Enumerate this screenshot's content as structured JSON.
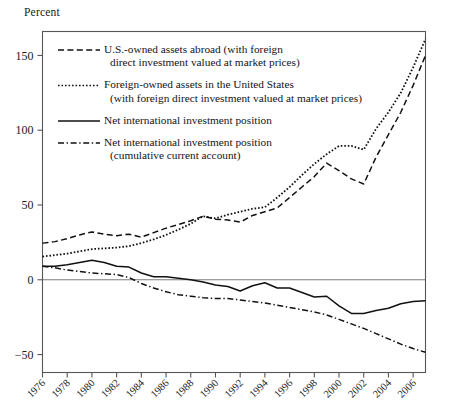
{
  "figure": {
    "axis_label_top": "Percent",
    "background_color": "#ffffff",
    "line_color": "#111114",
    "axis_color": "#55555a"
  },
  "chart_data": {
    "type": "line",
    "title": "",
    "xlabel": "",
    "ylabel": "Percent",
    "grid": false,
    "legend_position": "upper-left-inside",
    "xlim": [
      1976,
      2007
    ],
    "ylim": [
      -62,
      166
    ],
    "yticks": [
      150,
      100,
      50,
      0,
      -50
    ],
    "ytick_labels": [
      "150",
      "100",
      "50",
      "0",
      "−50"
    ],
    "xticks": [
      1976,
      1978,
      1980,
      1982,
      1984,
      1986,
      1988,
      1990,
      1992,
      1994,
      1996,
      1998,
      2000,
      2002,
      2004,
      2006
    ],
    "xtick_labels": [
      "1976",
      "1978",
      "1980",
      "1982",
      "1984",
      "1986",
      "1988",
      "1990",
      "1992",
      "1994",
      "1996",
      "1998",
      "2000",
      "2002",
      "2004",
      "2006"
    ],
    "x": [
      1976,
      1977,
      1978,
      1979,
      1980,
      1981,
      1982,
      1983,
      1984,
      1985,
      1986,
      1987,
      1988,
      1989,
      1990,
      1991,
      1992,
      1993,
      1994,
      1995,
      1996,
      1997,
      1998,
      1999,
      2000,
      2001,
      2002,
      2003,
      2004,
      2005,
      2006,
      2007
    ],
    "series": [
      {
        "name": "U.S.-owned assets abroad (with foreign direct investment valued at market prices)",
        "style": "dashed",
        "values": [
          24.5,
          25.5,
          27.5,
          30.0,
          32.0,
          30.5,
          29.5,
          30.5,
          28.5,
          31.5,
          34.5,
          37.0,
          39.5,
          42.5,
          40.5,
          40.0,
          38.5,
          43.0,
          45.5,
          48.0,
          55.0,
          62.0,
          69.0,
          78.0,
          73.0,
          67.5,
          64.0,
          82.0,
          97.0,
          112.0,
          130.0,
          150.0
        ]
      },
      {
        "name": "Foreign-owned assets in the United States (with foreign direct investment valued at market prices)",
        "style": "dotted",
        "values": [
          15.5,
          16.5,
          17.5,
          19.0,
          20.5,
          21.0,
          21.5,
          22.5,
          24.5,
          27.0,
          30.0,
          33.5,
          37.5,
          42.5,
          41.0,
          43.5,
          45.5,
          47.5,
          48.5,
          55.0,
          62.0,
          70.0,
          77.5,
          84.0,
          89.5,
          89.5,
          87.0,
          101.0,
          112.0,
          125.0,
          142.0,
          161.0
        ]
      },
      {
        "name": "Net international investment position",
        "style": "solid",
        "values": [
          9.0,
          9.0,
          10.0,
          11.5,
          13.0,
          11.5,
          9.0,
          8.5,
          4.5,
          2.0,
          2.0,
          1.0,
          0.0,
          -1.5,
          -3.5,
          -4.5,
          -7.5,
          -4.0,
          -2.0,
          -5.5,
          -5.5,
          -8.5,
          -11.5,
          -11.0,
          -17.5,
          -22.5,
          -22.5,
          -20.5,
          -19.0,
          -16.0,
          -14.5,
          -14.0
        ]
      },
      {
        "name": "Net international investment position (cumulative current account)",
        "style": "dashdot",
        "values": [
          9.0,
          8.0,
          6.5,
          5.5,
          4.5,
          4.0,
          3.5,
          1.5,
          -2.5,
          -5.5,
          -8.0,
          -10.0,
          -11.0,
          -12.0,
          -12.5,
          -12.5,
          -13.5,
          -14.5,
          -15.5,
          -17.0,
          -18.5,
          -20.0,
          -21.5,
          -23.5,
          -26.5,
          -29.5,
          -32.5,
          -36.0,
          -39.5,
          -43.0,
          -46.0,
          -48.5
        ]
      }
    ]
  },
  "legend": {
    "entries": [
      {
        "style": "dashed",
        "line1": "U.S.-owned assets abroad (with foreign",
        "line2": "direct investment valued at market prices)"
      },
      {
        "style": "dotted",
        "line1": "Foreign-owned assets in the United States",
        "line2": "(with foreign direct investment valued at market prices)"
      },
      {
        "style": "solid",
        "line1": "Net international investment position",
        "line2": ""
      },
      {
        "style": "dashdot",
        "line1": "Net international investment position",
        "line2": "(cumulative current account)"
      }
    ]
  }
}
